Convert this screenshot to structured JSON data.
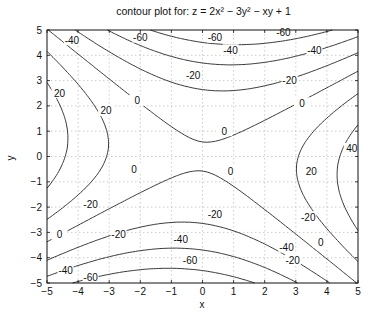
{
  "chart_data": {
    "type": "contour",
    "title": "contour plot for: z = 2x² − 3y² − xy + 1",
    "function": "z = 2x^2 - 3y^2 - xy + 1",
    "xlabel": "x",
    "ylabel": "y",
    "xlim": [
      -5,
      5
    ],
    "ylim": [
      -5,
      5
    ],
    "xticks": [
      "-5",
      "-4",
      "-3",
      "-2",
      "-1",
      "0",
      "1",
      "2",
      "3",
      "4",
      "5"
    ],
    "yticks": [
      "-5",
      "-4",
      "-3",
      "-2",
      "-1",
      "0",
      "1",
      "2",
      "3",
      "4",
      "5"
    ],
    "grid": true,
    "levels": [
      -60,
      -40,
      -20,
      0,
      20,
      40
    ],
    "label_positions": [
      {
        "text": "-40",
        "x": -4.2,
        "y": 4.6
      },
      {
        "text": "-60",
        "x": -2.0,
        "y": 4.7
      },
      {
        "text": "-60",
        "x": 0.4,
        "y": 4.7
      },
      {
        "text": "-60",
        "x": 2.6,
        "y": 4.9
      },
      {
        "text": "-40",
        "x": 0.9,
        "y": 4.2
      },
      {
        "text": "-40",
        "x": 3.6,
        "y": 4.2
      },
      {
        "text": "-20",
        "x": -0.3,
        "y": 3.2
      },
      {
        "text": "-20",
        "x": 2.8,
        "y": 3.0
      },
      {
        "text": "0",
        "x": -2.1,
        "y": 2.2
      },
      {
        "text": "0",
        "x": 0.7,
        "y": 1.0
      },
      {
        "text": "0",
        "x": 3.2,
        "y": 2.1
      },
      {
        "text": "20",
        "x": -4.6,
        "y": 2.5
      },
      {
        "text": "20",
        "x": -3.1,
        "y": 1.8
      },
      {
        "text": "40",
        "x": 4.8,
        "y": 0.3
      },
      {
        "text": "20",
        "x": 3.5,
        "y": -0.6
      },
      {
        "text": "0",
        "x": -2.2,
        "y": -0.5
      },
      {
        "text": "0",
        "x": 0.9,
        "y": -0.6
      },
      {
        "text": "-20",
        "x": -3.6,
        "y": -1.9
      },
      {
        "text": "-20",
        "x": 3.4,
        "y": -2.4
      },
      {
        "text": "0",
        "x": -4.6,
        "y": -3.1
      },
      {
        "text": "0",
        "x": 3.8,
        "y": -3.4
      },
      {
        "text": "-20",
        "x": -2.7,
        "y": -3.1
      },
      {
        "text": "-20",
        "x": 0.4,
        "y": -2.3
      },
      {
        "text": "-20",
        "x": 2.9,
        "y": -4.1
      },
      {
        "text": "-40",
        "x": -0.7,
        "y": -3.3
      },
      {
        "text": "-40",
        "x": 2.7,
        "y": -3.6
      },
      {
        "text": "-40",
        "x": -4.4,
        "y": -4.5
      },
      {
        "text": "-60",
        "x": -3.6,
        "y": -4.8
      },
      {
        "text": "-60",
        "x": -0.4,
        "y": -4.1
      }
    ]
  }
}
